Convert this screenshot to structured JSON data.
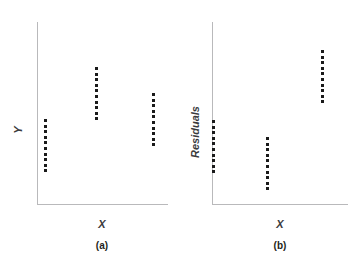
{
  "figure": {
    "background_color": "#ffffff",
    "axis_color": "#b9b9bb",
    "dot_color": "#1a1a1a"
  },
  "panels": [
    {
      "id": "a",
      "caption": "(a)",
      "xlabel": "X",
      "ylabel": "Y"
    },
    {
      "id": "b",
      "caption": "(b)",
      "xlabel": "X",
      "ylabel": "Residuals"
    }
  ],
  "chart_data": [
    {
      "type": "scatter",
      "title": "(a)",
      "xlabel": "X",
      "ylabel": "Y",
      "grid": false,
      "legend": false,
      "axis_ticks": false,
      "xlim": [
        0,
        10
      ],
      "ylim": [
        0,
        10
      ],
      "description": "Three vertical columns of points at three X levels; group means rise then fall, showing a curved (non-linear) relation.",
      "series": [
        {
          "name": "group-1",
          "x": 1.4,
          "n_points": 10,
          "y_top": 6.0,
          "y_bottom": 3.6,
          "points": [
            {
              "x": 1.4,
              "y": 6.0
            },
            {
              "x": 1.4,
              "y": 5.73
            },
            {
              "x": 1.4,
              "y": 5.47
            },
            {
              "x": 1.4,
              "y": 5.2
            },
            {
              "x": 1.4,
              "y": 4.93
            },
            {
              "x": 1.4,
              "y": 4.67
            },
            {
              "x": 1.4,
              "y": 4.4
            },
            {
              "x": 1.4,
              "y": 4.13
            },
            {
              "x": 1.4,
              "y": 3.87
            },
            {
              "x": 1.4,
              "y": 3.6
            }
          ]
        },
        {
          "name": "group-2",
          "x": 5.0,
          "n_points": 10,
          "y_top": 8.6,
          "y_bottom": 6.2,
          "points": [
            {
              "x": 5.0,
              "y": 8.6
            },
            {
              "x": 5.0,
              "y": 8.33
            },
            {
              "x": 5.0,
              "y": 8.07
            },
            {
              "x": 5.0,
              "y": 7.8
            },
            {
              "x": 5.0,
              "y": 7.53
            },
            {
              "x": 5.0,
              "y": 7.27
            },
            {
              "x": 5.0,
              "y": 7.0
            },
            {
              "x": 5.0,
              "y": 6.73
            },
            {
              "x": 5.0,
              "y": 6.47
            },
            {
              "x": 5.0,
              "y": 6.2
            }
          ]
        },
        {
          "name": "group-3",
          "x": 8.1,
          "n_points": 10,
          "y_top": 7.5,
          "y_bottom": 5.1,
          "points": [
            {
              "x": 8.1,
              "y": 7.5
            },
            {
              "x": 8.1,
              "y": 7.23
            },
            {
              "x": 8.1,
              "y": 6.97
            },
            {
              "x": 8.1,
              "y": 6.7
            },
            {
              "x": 8.1,
              "y": 6.43
            },
            {
              "x": 8.1,
              "y": 6.17
            },
            {
              "x": 8.1,
              "y": 5.9
            },
            {
              "x": 8.1,
              "y": 5.63
            },
            {
              "x": 8.1,
              "y": 5.37
            },
            {
              "x": 8.1,
              "y": 5.1
            }
          ]
        }
      ]
    },
    {
      "type": "scatter",
      "title": "(b)",
      "xlabel": "X",
      "ylabel": "Residuals",
      "grid": false,
      "legend": false,
      "axis_ticks": false,
      "xlim": [
        0,
        10
      ],
      "ylim": [
        0,
        10
      ],
      "description": "Residuals plotted against X for the same three groups; the columns dip then rise sharply, revealing systematic non-random pattern.",
      "series": [
        {
          "name": "group-1",
          "x": 1.4,
          "n_points": 10,
          "y_top": 5.7,
          "y_bottom": 3.6,
          "points": [
            {
              "x": 1.4,
              "y": 5.7
            },
            {
              "x": 1.4,
              "y": 5.47
            },
            {
              "x": 1.4,
              "y": 5.23
            },
            {
              "x": 1.4,
              "y": 5.0
            },
            {
              "x": 1.4,
              "y": 4.77
            },
            {
              "x": 1.4,
              "y": 4.53
            },
            {
              "x": 1.4,
              "y": 4.3
            },
            {
              "x": 1.4,
              "y": 4.07
            },
            {
              "x": 1.4,
              "y": 3.83
            },
            {
              "x": 1.4,
              "y": 3.6
            }
          ]
        },
        {
          "name": "group-2",
          "x": 4.7,
          "n_points": 10,
          "y_top": 4.8,
          "y_bottom": 2.5,
          "points": [
            {
              "x": 4.7,
              "y": 4.8
            },
            {
              "x": 4.7,
              "y": 4.54
            },
            {
              "x": 4.7,
              "y": 4.29
            },
            {
              "x": 4.7,
              "y": 4.03
            },
            {
              "x": 4.7,
              "y": 3.77
            },
            {
              "x": 4.7,
              "y": 3.52
            },
            {
              "x": 4.7,
              "y": 3.26
            },
            {
              "x": 4.7,
              "y": 3.01
            },
            {
              "x": 4.7,
              "y": 2.75
            },
            {
              "x": 4.7,
              "y": 2.5
            }
          ]
        },
        {
          "name": "group-3",
          "x": 8.4,
          "n_points": 10,
          "y_top": 9.2,
          "y_bottom": 7.0,
          "points": [
            {
              "x": 8.4,
              "y": 9.2
            },
            {
              "x": 8.4,
              "y": 8.96
            },
            {
              "x": 8.4,
              "y": 8.71
            },
            {
              "x": 8.4,
              "y": 8.47
            },
            {
              "x": 8.4,
              "y": 8.22
            },
            {
              "x": 8.4,
              "y": 7.98
            },
            {
              "x": 8.4,
              "y": 7.73
            },
            {
              "x": 8.4,
              "y": 7.49
            },
            {
              "x": 8.4,
              "y": 7.24
            },
            {
              "x": 8.4,
              "y": 7.0
            }
          ]
        }
      ]
    }
  ]
}
